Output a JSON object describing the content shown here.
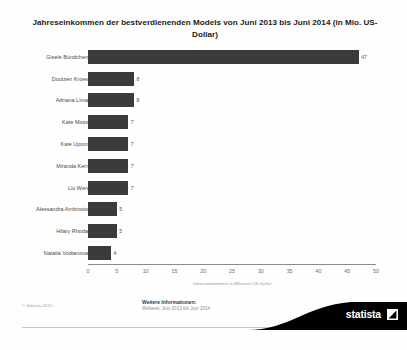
{
  "chart_data": {
    "type": "bar",
    "orientation": "horizontal",
    "title": "Jahreseinkommen der bestverdienenden Models von Juni 2013 bis Juni 2014 (in Mio. US-Dollar)",
    "categories": [
      "Gisele Bündchen",
      "Doutzen Kroes",
      "Adriana Lima",
      "Kate Moss",
      "Kate Upton",
      "Miranda Kerr",
      "Liu Wen",
      "Alessandra Ambrosio",
      "Hilary Rhoda",
      "Natalia Vodianova"
    ],
    "values": [
      47,
      8,
      8,
      7,
      7,
      7,
      7,
      5,
      5,
      4
    ],
    "xlabel": "Jahreseinkommen in Millionen US-Dollar",
    "ylabel": "",
    "xlim": [
      0,
      50
    ],
    "xticks": [
      0,
      5,
      10,
      15,
      20,
      25,
      30,
      35,
      40,
      45,
      50
    ],
    "xtick_labels": [
      "0",
      "5",
      "10",
      "15",
      "20",
      "25",
      "30",
      "35",
      "40",
      "45",
      "50"
    ],
    "grid": false,
    "legend": false,
    "bar_color": "#3b3b3b"
  },
  "footer": {
    "copyright": "© Statista 2015",
    "further_info_title": "Weitere Informationen:",
    "further_info_detail": "Weltweit; Juni 2013 bis Juni 2014",
    "brand": "statista"
  }
}
